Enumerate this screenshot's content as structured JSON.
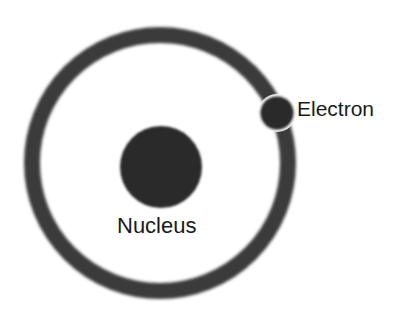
{
  "diagram": {
    "type": "bohr-atom-model",
    "orbit": {
      "cx": 160,
      "cy": 163,
      "r": 128,
      "stroke_width": 17,
      "color": "#3a3a3a"
    },
    "nucleus": {
      "cx": 161,
      "cy": 167,
      "r": 41,
      "color": "#2b2b2b",
      "label": "Nucleus"
    },
    "electron": {
      "cx": 277,
      "cy": 113,
      "r": 17,
      "color": "#2b2b2b",
      "outline": "#f2f2f2",
      "label": "Electron"
    },
    "background": "#ffffff"
  }
}
